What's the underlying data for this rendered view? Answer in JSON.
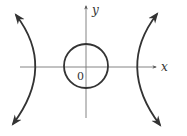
{
  "diagram": {
    "axes": {
      "x_label": "x",
      "y_label": "y",
      "origin_label": "0",
      "axis_color": "#666666"
    },
    "curves": [
      {
        "name": "circle",
        "description": "circle centered at origin"
      },
      {
        "name": "left-hyperbola-branch",
        "description": "left branch of hyperbola opening left, arrows at both ends"
      },
      {
        "name": "right-hyperbola-branch",
        "description": "right branch of hyperbola opening right, arrows at both ends"
      }
    ],
    "stroke_color": "#333333"
  }
}
